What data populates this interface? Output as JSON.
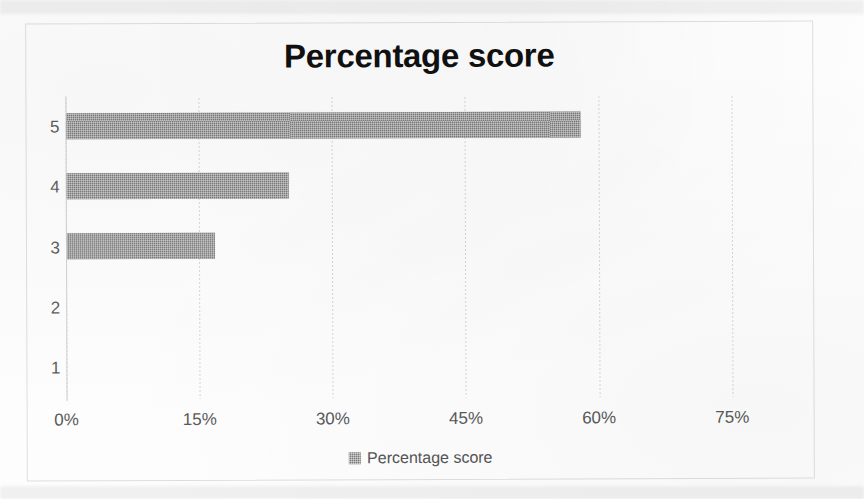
{
  "chart_data": {
    "type": "bar",
    "orientation": "horizontal",
    "title": "Percentage score",
    "xlabel": "",
    "ylabel": "",
    "categories": [
      "5",
      "4",
      "3",
      "2",
      "1"
    ],
    "values": [
      57.9,
      25.0,
      16.7,
      0,
      0
    ],
    "series": [
      {
        "name": "Percentage score",
        "values": [
          57.9,
          25.0,
          16.7,
          0,
          0
        ]
      }
    ],
    "xlim": [
      0,
      80
    ],
    "x_ticks": [
      0,
      15,
      30,
      45,
      60,
      75
    ],
    "x_tick_labels": [
      "0%",
      "15%",
      "30%",
      "45%",
      "60%",
      "75%"
    ],
    "y_tick_labels": [
      "5",
      "4",
      "3",
      "2",
      "1"
    ],
    "grid": true,
    "grid_axis": "x",
    "legend": {
      "position": "bottom",
      "entries": [
        "Percentage score"
      ]
    },
    "colors": {
      "bar": "#7b7b7b",
      "title": "#101010",
      "tick_label": "#595959",
      "gridline": "#d6d6d6",
      "border": "#dedede",
      "background": "#fdfdfd"
    }
  }
}
